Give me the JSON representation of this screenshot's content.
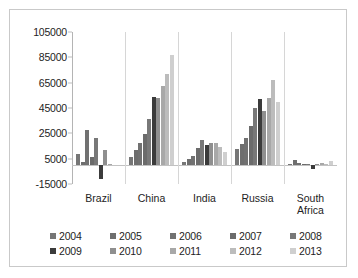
{
  "chart_data": {
    "type": "bar",
    "title": "",
    "subtitle": "",
    "xlabel": "",
    "ylabel": "",
    "ylim": [
      -15000,
      105000
    ],
    "yticks": [
      -15000,
      5000,
      25000,
      45000,
      65000,
      85000,
      105000
    ],
    "ytick_labels": [
      "-15000",
      "5000",
      "25000",
      "45000",
      "65000",
      "85000",
      "105000"
    ],
    "grid": false,
    "legend_position": "bottom",
    "categories": [
      "Brazil",
      "China",
      "India",
      "Russia",
      "South Africa"
    ],
    "category_labels": [
      [
        "Brazil"
      ],
      [
        "China"
      ],
      [
        "India"
      ],
      [
        "Russia"
      ],
      [
        "South",
        "Africa"
      ]
    ],
    "series": [
      {
        "name": "2004",
        "color": "#767676",
        "values": [
          9000,
          6000,
          2000,
          12500,
          1000
        ]
      },
      {
        "name": "2005",
        "color": "#6e6e6e",
        "values": [
          2500,
          12000,
          4500,
          16500,
          4000
        ]
      },
      {
        "name": "2006",
        "color": "#717171",
        "values": [
          28000,
          17500,
          7500,
          21500,
          1200
        ]
      },
      {
        "name": "2007",
        "color": "#6b6b6b",
        "values": [
          6000,
          24500,
          13500,
          30500,
          1000
        ]
      },
      {
        "name": "2008",
        "color": "#787878",
        "values": [
          21500,
          36500,
          20000,
          45000,
          1000
        ]
      },
      {
        "name": "2009",
        "color": "#3b3b3b",
        "values": [
          -11000,
          53500,
          15500,
          52000,
          -3500
        ]
      },
      {
        "name": "2010",
        "color": "#8f8f8f",
        "values": [
          12000,
          53000,
          17000,
          43000,
          1000
        ]
      },
      {
        "name": "2011",
        "color": "#a8a8a8",
        "values": [
          500,
          62500,
          17000,
          53000,
          1200
        ]
      },
      {
        "name": "2012",
        "color": "#bcbcbc",
        "values": [
          0,
          72000,
          14000,
          67000,
          1000
        ]
      },
      {
        "name": "2013",
        "color": "#cfcfcf",
        "values": [
          0,
          87000,
          10000,
          49500,
          3500
        ]
      }
    ]
  },
  "legend": {
    "rows": [
      [
        {
          "label": "2004",
          "color": "#767676"
        },
        {
          "label": "2005",
          "color": "#6e6e6e"
        },
        {
          "label": "2006",
          "color": "#717171"
        },
        {
          "label": "2007",
          "color": "#6b6b6b"
        },
        {
          "label": "2008",
          "color": "#787878"
        }
      ],
      [
        {
          "label": "2009",
          "color": "#3b3b3b"
        },
        {
          "label": "2010",
          "color": "#8f8f8f"
        },
        {
          "label": "2011",
          "color": "#a8a8a8"
        },
        {
          "label": "2012",
          "color": "#bcbcbc"
        },
        {
          "label": "2013",
          "color": "#cfcfcf"
        }
      ]
    ]
  }
}
